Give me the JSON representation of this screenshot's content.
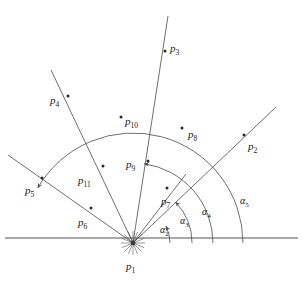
{
  "figure": {
    "type": "angle-fan-diagram",
    "background": "#ffffff",
    "stroke_color": "#555555",
    "text_color": "#1a1a1a",
    "vertex": {
      "name": "p1",
      "x": 133,
      "y": 243
    },
    "baseline": {
      "x1": 5,
      "y1": 238,
      "x2": 298,
      "y2": 238
    }
  },
  "points": [
    {
      "id": "p1",
      "label": "p",
      "sub": "1",
      "dot_x": 133,
      "dot_y": 243,
      "label_x": 126,
      "label_y": 261,
      "has_dot": false
    },
    {
      "id": "p2",
      "label": "p",
      "sub": "2",
      "dot_x": 244,
      "dot_y": 135,
      "label_x": 248,
      "label_y": 141,
      "has_dot": true
    },
    {
      "id": "p3",
      "label": "p",
      "sub": "3",
      "dot_x": 165,
      "dot_y": 51,
      "label_x": 170,
      "label_y": 43,
      "has_dot": true
    },
    {
      "id": "p4",
      "label": "p",
      "sub": "4",
      "dot_x": 68,
      "dot_y": 96,
      "label_x": 50,
      "label_y": 95,
      "has_dot": true
    },
    {
      "id": "p5",
      "label": "p",
      "sub": "5",
      "dot_x": 42,
      "dot_y": 178,
      "label_x": 25,
      "label_y": 185,
      "has_dot": true
    },
    {
      "id": "p6",
      "label": "p",
      "sub": "6",
      "dot_x": 91,
      "dot_y": 208,
      "label_x": 78,
      "label_y": 217,
      "has_dot": true
    },
    {
      "id": "p7",
      "label": "p",
      "sub": "7",
      "dot_x": 167,
      "dot_y": 188,
      "label_x": 161,
      "label_y": 196,
      "has_dot": true
    },
    {
      "id": "p8",
      "label": "p",
      "sub": "8",
      "dot_x": 182,
      "dot_y": 128,
      "label_x": 188,
      "label_y": 129,
      "has_dot": true
    },
    {
      "id": "p9",
      "label": "p",
      "sub": "9",
      "dot_x": 148,
      "dot_y": 161,
      "label_x": 126,
      "label_y": 159,
      "has_dot": true
    },
    {
      "id": "p10",
      "label": "p",
      "sub": "10",
      "dot_x": 121,
      "dot_y": 117,
      "label_x": 125,
      "label_y": 116,
      "has_dot": true
    },
    {
      "id": "p11",
      "label": "p",
      "sub": "11",
      "dot_x": 103,
      "dot_y": 166,
      "label_x": 78,
      "label_y": 175,
      "has_dot": true
    }
  ],
  "rays": [
    {
      "id": "ray-p2",
      "end_x": 276,
      "end_y": 107,
      "angle_deg": 44
    },
    {
      "id": "ray-p3",
      "end_x": 168,
      "end_y": 16,
      "angle_deg": 82
    },
    {
      "id": "ray-p4",
      "end_x": 51,
      "end_y": 70,
      "angle_deg": 115
    },
    {
      "id": "ray-p5",
      "end_x": 8,
      "end_y": 155,
      "angle_deg": 150
    },
    {
      "id": "ray-p7",
      "end_x": 186,
      "end_y": 174,
      "angle_deg": 27
    }
  ],
  "arcs": [
    {
      "id": "arc-alpha2",
      "radius": 37,
      "label": "α",
      "sub": "2",
      "label_x": 160,
      "label_y": 225,
      "start_deg": 0,
      "end_deg": 27
    },
    {
      "id": "arc-alpha3",
      "radius": 59,
      "label": "α",
      "sub": "3",
      "label_x": 180,
      "label_y": 216,
      "start_deg": 0,
      "end_deg": 44
    },
    {
      "id": "arc-alpha4",
      "radius": 80,
      "label": "α",
      "sub": "4",
      "label_x": 202,
      "label_y": 207,
      "start_deg": 0,
      "end_deg": 82
    },
    {
      "id": "arc-alpha5",
      "radius": 110,
      "label": "α",
      "sub": "5",
      "label_x": 240,
      "label_y": 196,
      "start_deg": 0,
      "end_deg": 150
    }
  ],
  "angle_labels": [
    "α2",
    "α3",
    "α4",
    "α5"
  ],
  "point_labels": [
    "p1",
    "p2",
    "p3",
    "p4",
    "p5",
    "p6",
    "p7",
    "p8",
    "p9",
    "p10",
    "p11"
  ]
}
